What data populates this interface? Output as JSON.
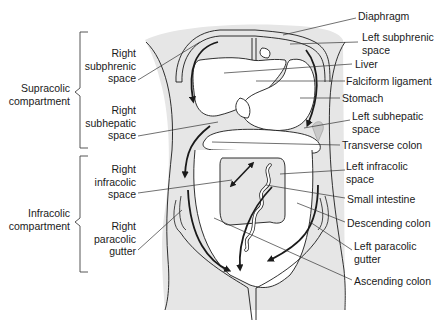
{
  "diagram": {
    "colors": {
      "fill": "#e6e6e6",
      "stroke": "#1a1a1a",
      "background": "#ffffff"
    },
    "left_labels": {
      "brackets": [
        {
          "id": "supracolic",
          "text": "Supracolic\ncompartment"
        },
        {
          "id": "infracolic",
          "text": "Infracolic\ncompartment"
        }
      ],
      "spaces": [
        {
          "id": "right-subphrenic",
          "text": "Right\nsubphrenic\nspace"
        },
        {
          "id": "right-subhepatic",
          "text": "Right\nsubhepatic\nspace"
        },
        {
          "id": "right-infracolic",
          "text": "Right\ninfracolic\nspace"
        },
        {
          "id": "right-paracolic",
          "text": "Right\nparacolic\ngutter"
        }
      ]
    },
    "right_labels": [
      {
        "id": "diaphragm",
        "text": "Diaphragm"
      },
      {
        "id": "left-subphrenic",
        "text": "Left subphrenic\nspace"
      },
      {
        "id": "liver",
        "text": "Liver"
      },
      {
        "id": "falciform",
        "text": "Falciform ligament"
      },
      {
        "id": "stomach",
        "text": "Stomach"
      },
      {
        "id": "left-subhepatic",
        "text": "Left subhepatic\nspace"
      },
      {
        "id": "transverse-colon",
        "text": "Transverse colon"
      },
      {
        "id": "left-infracolic",
        "text": "Left infracolic\nspace"
      },
      {
        "id": "small-intestine",
        "text": "Small intestine"
      },
      {
        "id": "descending-colon",
        "text": "Descending colon"
      },
      {
        "id": "left-paracolic",
        "text": "Left paracolic\ngutter"
      },
      {
        "id": "ascending-colon",
        "text": "Ascending colon"
      }
    ]
  }
}
